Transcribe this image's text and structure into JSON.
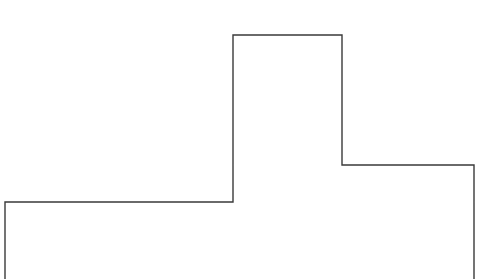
{
  "diagram": {
    "type": "stepped-outline",
    "stroke_color": "#3a3a3a",
    "background_color": "#ffffff",
    "stroke_width": 1.4,
    "points": [
      [
        5,
        279
      ],
      [
        5,
        202
      ],
      [
        233,
        202
      ],
      [
        233,
        35
      ],
      [
        342,
        35
      ],
      [
        342,
        165
      ],
      [
        474,
        165
      ],
      [
        474,
        279
      ]
    ]
  }
}
